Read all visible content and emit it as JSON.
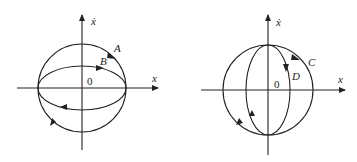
{
  "figures": [
    {
      "id": "left",
      "x_axis_label": "x",
      "y_axis_label": "ẋ",
      "origin_label": "0",
      "trajectories": [
        {
          "name": "A",
          "label": "A",
          "shape": "circle",
          "direction": "clockwise"
        },
        {
          "name": "B",
          "label": "B",
          "shape": "flat-ellipse",
          "direction": "clockwise"
        }
      ]
    },
    {
      "id": "right",
      "x_axis_label": "x",
      "y_axis_label": "ẋ",
      "origin_label": "0",
      "trajectories": [
        {
          "name": "C",
          "label": "C",
          "shape": "circle",
          "direction": "clockwise"
        },
        {
          "name": "D",
          "label": "D",
          "shape": "tall-ellipse",
          "direction": "clockwise"
        }
      ]
    }
  ]
}
